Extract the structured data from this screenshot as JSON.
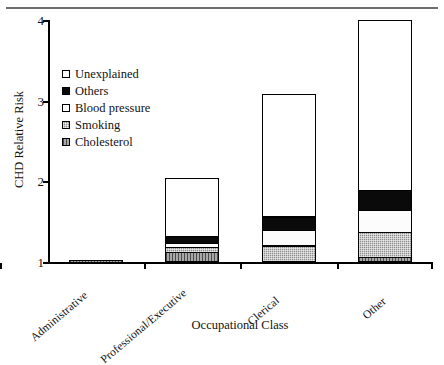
{
  "figure": {
    "has_top_rule": true
  },
  "chart_data": {
    "type": "bar",
    "stacked": true,
    "title": "",
    "xlabel": "Occupational Class",
    "ylabel": "CHD Relative Risk",
    "categories": [
      "Administrative",
      "Professional/Executive",
      "Clerical",
      "Other"
    ],
    "ylim": [
      1,
      4
    ],
    "yticks": [
      1,
      2,
      3,
      4
    ],
    "ytick_labels": [
      "1",
      "2",
      "3",
      "4"
    ],
    "grid": false,
    "baseline": 1.0,
    "legend_position": "upper-left-inside",
    "series": [
      {
        "name": "Cholesterol",
        "fill": "gray-vertical-hatch",
        "color": "#a8a8a8",
        "values": [
          1.03,
          1.14,
          1.03,
          1.08
        ]
      },
      {
        "name": "Smoking",
        "fill": "gray-crosshatch",
        "color": "#8d8d8d",
        "values": [
          1.03,
          1.2,
          1.22,
          1.39
        ]
      },
      {
        "name": "Blood pressure",
        "fill": "white",
        "color": "#fcfcfc",
        "values": [
          1.03,
          1.25,
          1.41,
          1.66
        ]
      },
      {
        "name": "Others",
        "fill": "black",
        "color": "#0a0a0a",
        "values": [
          1.03,
          1.34,
          1.58,
          1.91
        ]
      },
      {
        "name": "Unexplained",
        "fill": "white",
        "color": "#ffffff",
        "values": [
          1.03,
          2.04,
          3.08,
          4.0
        ]
      }
    ],
    "cumulative_tops": {
      "Administrative": {
        "Cholesterol": 1.03,
        "Smoking": 1.03,
        "Blood pressure": 1.03,
        "Others": 1.03,
        "Unexplained": 1.03
      },
      "Professional/Executive": {
        "Cholesterol": 1.14,
        "Smoking": 1.2,
        "Blood pressure": 1.25,
        "Others": 1.34,
        "Unexplained": 2.04
      },
      "Clerical": {
        "Cholesterol": 1.03,
        "Smoking": 1.22,
        "Blood pressure": 1.41,
        "Others": 1.58,
        "Unexplained": 3.08
      },
      "Other": {
        "Cholesterol": 1.08,
        "Smoking": 1.39,
        "Blood pressure": 1.66,
        "Others": 1.91,
        "Unexplained": 4.0
      }
    },
    "totals": [
      1.03,
      2.04,
      3.08,
      4.0
    ]
  },
  "legend": {
    "items": [
      {
        "label": "Unexplained",
        "swatch": "white"
      },
      {
        "label": "Others",
        "swatch": "black"
      },
      {
        "label": "Blood pressure",
        "swatch": "white"
      },
      {
        "label": "Smoking",
        "swatch": "gray"
      },
      {
        "label": "Cholesterol",
        "swatch": "gray-hatch"
      }
    ]
  },
  "axes": {
    "y_title": "CHD Relative Risk",
    "x_title": "Occupational Class",
    "y_tick_labels": [
      "4",
      "3",
      "2",
      "1"
    ],
    "x_tick_labels": [
      "Administrative",
      "Professional/Executive",
      "Clerical",
      "Other"
    ]
  }
}
